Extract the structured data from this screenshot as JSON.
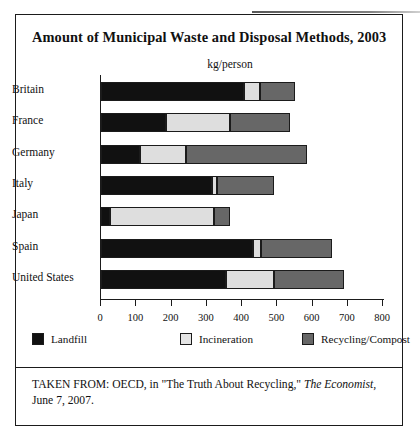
{
  "figure": {
    "title": "Amount of Municipal Waste and Disposal Methods, 2003",
    "units_label": "kg/person",
    "caption_part1": "TAKEN FROM: OECD, in \"The Truth About Recycling,\" ",
    "caption_source": "The Economist,",
    "caption_part2": " June 7, 2007."
  },
  "colors": {
    "landfill": "#111111",
    "incineration": "#dedede",
    "recycling": "#676767",
    "axis": "#1b1b1b",
    "background": "#ffffff"
  },
  "legend": [
    {
      "label": "Landfill",
      "key": "landfill"
    },
    {
      "label": "Incineration",
      "key": "incineration"
    },
    {
      "label": "Recycling/Compost",
      "key": "recycling"
    }
  ],
  "axis": {
    "ticks": [
      "0",
      "100",
      "200",
      "300",
      "400",
      "500",
      "600",
      "700",
      "800"
    ]
  },
  "chart_data": {
    "type": "bar",
    "orientation": "horizontal",
    "stacked": true,
    "title": "Amount of Municipal Waste and Disposal Methods, 2003",
    "xlabel": "kg/person",
    "ylabel": "",
    "xlim": [
      0,
      800
    ],
    "xticks": [
      0,
      100,
      200,
      300,
      400,
      500,
      600,
      700,
      800
    ],
    "grid": false,
    "legend_position": "bottom",
    "categories": [
      "Britain",
      "France",
      "Germany",
      "Italy",
      "Japan",
      "Spain",
      "United States"
    ],
    "series": [
      {
        "name": "Landfill",
        "values": [
          405,
          185,
          110,
          315,
          25,
          430,
          355
        ]
      },
      {
        "name": "Incineration",
        "values": [
          45,
          180,
          130,
          15,
          295,
          25,
          135
        ]
      },
      {
        "name": "Recycling/Compost",
        "values": [
          100,
          170,
          345,
          160,
          45,
          200,
          200
        ]
      }
    ],
    "totals": [
      550,
      535,
      585,
      490,
      365,
      655,
      690
    ]
  }
}
